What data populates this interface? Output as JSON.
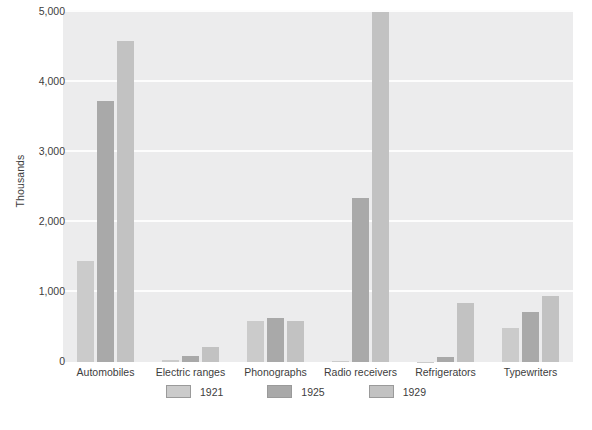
{
  "chart_data": {
    "type": "bar",
    "title": "",
    "subtitle": "",
    "xlabel": "",
    "ylabel": "Thousands",
    "categories": [
      "Automobiles",
      "Electric ranges",
      "Phonographs",
      "Radio receivers",
      "Refrigerators",
      "Typewriters"
    ],
    "series": [
      {
        "name": "1921",
        "color": "#cbcbcb",
        "values": [
          1450,
          30,
          590,
          10,
          5,
          490
        ]
      },
      {
        "name": "1925",
        "color": "#a9a9a9",
        "values": [
          3730,
          90,
          625,
          2340,
          75,
          720
        ]
      },
      {
        "name": "1929",
        "color": "#c2c2c2",
        "values": [
          4580,
          220,
          580,
          5000,
          850,
          950
        ]
      }
    ],
    "ylim": [
      0,
      5000
    ],
    "yticks": [
      0,
      1000,
      2000,
      3000,
      4000,
      5000
    ],
    "ytick_labels": [
      "0",
      "1,000",
      "2,000",
      "3,000",
      "4,000",
      "5,000"
    ],
    "grid": "horizontal",
    "grid_color": "#fdfdfd",
    "plot_background": "#ececed",
    "legend_position": "bottom",
    "legend_entries": [
      "1921",
      "1925",
      "1929"
    ]
  },
  "footer": {
    "artifact_left": "",
    "artifact_mid": ""
  }
}
